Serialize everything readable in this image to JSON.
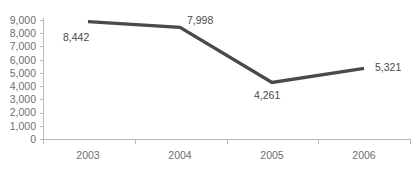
{
  "chart_data": {
    "type": "line",
    "title": "",
    "subtitle": "",
    "xlabel": "",
    "ylabel": "",
    "categories": [
      "2003",
      "2004",
      "2005",
      "2006"
    ],
    "values": [
      8442,
      7998,
      4261,
      5321
    ],
    "data_labels": [
      "8,442",
      "7,998",
      "4,261",
      "5,321"
    ],
    "series": [
      {
        "name": "",
        "values": [
          8442,
          7998,
          4261,
          5321
        ],
        "color": "#4a4a4a"
      }
    ],
    "ylim": [
      0,
      9000
    ],
    "ytick_values": [
      0,
      1000,
      2000,
      3000,
      4000,
      5000,
      6000,
      7000,
      8000,
      9000
    ],
    "ytick_labels": [
      "9,000",
      "8,000",
      "7,000",
      "6,000",
      "5,000",
      "4,000",
      "3,000",
      "2,000",
      "1,000",
      "0"
    ],
    "grid": false,
    "legend": false,
    "legend_position": "none",
    "annotations": []
  },
  "style": {
    "line_color": "#4a4a4a",
    "axis_color": "#b9b9b9",
    "tick_label_color": "#6f6f6f",
    "data_label_color": "#4a4a4a",
    "background": "#ffffff"
  },
  "axis": {
    "y_labels": [
      {
        "text": "9,000",
        "y": 20
      },
      {
        "text": "8,000",
        "y": 33.2
      },
      {
        "text": "7,000",
        "y": 46.4
      },
      {
        "text": "6,000",
        "y": 59.7
      },
      {
        "text": "5,000",
        "y": 72.9
      },
      {
        "text": "4,000",
        "y": 86.1
      },
      {
        "text": "3,000",
        "y": 99.4
      },
      {
        "text": "2,000",
        "y": 112.6
      },
      {
        "text": "1,000",
        "y": 125.8
      },
      {
        "text": "0",
        "y": 139
      }
    ],
    "x_labels": [
      {
        "text": "2003",
        "x": 88
      },
      {
        "text": "2004",
        "x": 180
      },
      {
        "text": "2005",
        "x": 272
      },
      {
        "text": "2006",
        "x": 364
      }
    ]
  },
  "points": [
    {
      "label": "8,442",
      "x": 88,
      "y": 21.6,
      "label_x": 63,
      "label_y": 41
    },
    {
      "label": "7,998",
      "x": 180,
      "y": 27.4,
      "label_x": 187,
      "label_y": 24
    },
    {
      "label": "4,261",
      "x": 272,
      "y": 82.4,
      "label_x": 254,
      "label_y": 99
    },
    {
      "label": "5,321",
      "x": 364,
      "y": 68.4,
      "label_x": 375,
      "label_y": 71
    }
  ]
}
